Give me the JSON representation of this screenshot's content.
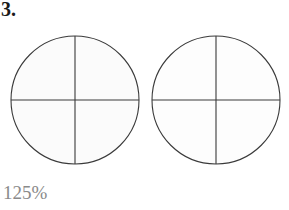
{
  "page": {
    "background_color": "#ffffff",
    "width": 289,
    "height": 210
  },
  "problem": {
    "number_label": "3.",
    "number_color": "#1a1a1a"
  },
  "figures": {
    "count": 2,
    "description": "two circles each divided into four equal quadrants",
    "stroke_color": "#3a3a3a",
    "fill_color": "#fbfbfb",
    "items": [
      {
        "id": "circle-left",
        "cx": 75,
        "cy": 100,
        "r": 64,
        "divisions": 4,
        "division_lines": [
          "vertical-diameter",
          "horizontal-diameter"
        ],
        "shaded_parts": 0
      },
      {
        "id": "circle-right",
        "cx": 216,
        "cy": 100,
        "r": 64,
        "divisions": 4,
        "division_lines": [
          "vertical-diameter",
          "horizontal-diameter"
        ],
        "shaded_parts": 0
      }
    ]
  },
  "zoom": {
    "value_label": "125%",
    "color": "#8a8a8a"
  }
}
